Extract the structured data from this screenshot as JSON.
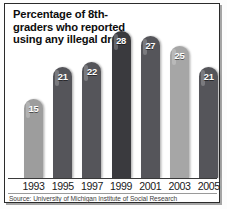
{
  "chart_data": {
    "type": "bar",
    "title": "Percentage of 8th-graders who reported using any illegal drug",
    "categories": [
      "1993",
      "1995",
      "1997",
      "1999",
      "2001",
      "2003",
      "2005"
    ],
    "values": [
      15,
      21,
      22,
      28,
      27,
      25,
      21
    ],
    "xlabel": "",
    "ylabel": "",
    "ylim": [
      0,
      30
    ],
    "grid": false,
    "legend": false,
    "source": "Source: University of Michigan Institute of Social Research",
    "bar_colors": [
      "#9d9d9d",
      "#55555a",
      "#55555a",
      "#3a3a3e",
      "#55555a",
      "#a6a6a6",
      "#55555a"
    ],
    "value_label_color": "#ffffff",
    "frame_color": "#2b2b2b",
    "background": "#ffffff"
  }
}
